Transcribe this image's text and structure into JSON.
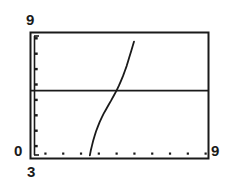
{
  "chart_data": {
    "type": "line",
    "title": "",
    "xlabel": "",
    "ylabel": "",
    "xlim": [
      3,
      9
    ],
    "ylim": [
      0,
      9
    ],
    "grid": false,
    "legend_position": "none",
    "axis_labels": {
      "y_max": "9",
      "y_min": "0",
      "x_min": "3",
      "x_max": "9"
    },
    "x_tick_values": [
      3.5,
      4.1,
      4.7,
      5.3,
      5.9,
      6.5,
      7.1,
      7.7,
      8.3,
      8.9
    ],
    "y_tick_values": [
      0.9,
      2.0,
      3.1,
      4.2,
      5.3,
      6.4,
      7.5,
      8.6
    ],
    "series": [
      {
        "name": "horizontal-reference-line",
        "type": "line",
        "style": "solid",
        "color": "#1a1a1a",
        "x": [
          3.0,
          9.0
        ],
        "y": [
          4.85,
          4.85
        ]
      },
      {
        "name": "steep-curve",
        "type": "line",
        "style": "solid",
        "color": "#1a1a1a",
        "x": [
          5.0,
          5.03,
          5.07,
          5.11,
          5.16,
          5.21,
          5.27,
          5.33,
          5.4,
          5.47,
          5.55,
          5.63,
          5.72,
          5.81,
          5.9,
          5.98,
          6.05,
          6.12,
          6.18,
          6.24,
          6.29,
          6.34,
          6.39,
          6.44,
          6.49
        ],
        "y": [
          0.22,
          0.55,
          0.9,
          1.25,
          1.6,
          1.95,
          2.28,
          2.6,
          2.92,
          3.22,
          3.52,
          3.82,
          4.15,
          4.5,
          4.85,
          5.2,
          5.55,
          5.9,
          6.25,
          6.6,
          6.95,
          7.3,
          7.65,
          8.0,
          8.35
        ]
      }
    ]
  },
  "frame": {
    "border_color": "#1a1a1a",
    "background": "#ffffff"
  }
}
